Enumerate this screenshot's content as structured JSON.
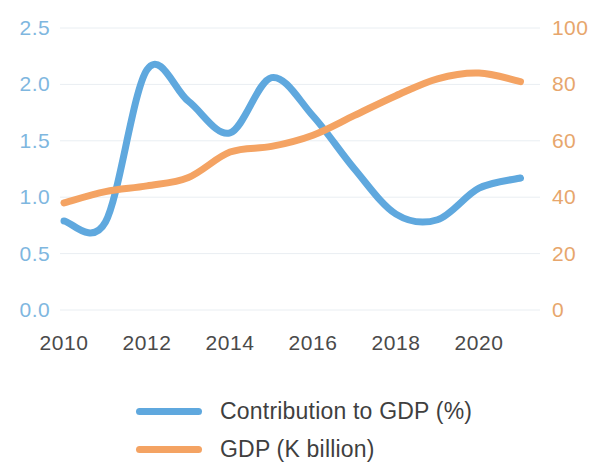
{
  "chart_data": {
    "type": "line",
    "title": "",
    "xlabel": "",
    "grid": true,
    "legend_position": "bottom",
    "x": [
      2010,
      2011,
      2012,
      2013,
      2014,
      2015,
      2016,
      2017,
      2018,
      2019,
      2020,
      2021
    ],
    "x_ticks": [
      "2010",
      "2012",
      "2014",
      "2016",
      "2018",
      "2020"
    ],
    "x_tick_values": [
      2010,
      2012,
      2014,
      2016,
      2018,
      2020
    ],
    "xlim": [
      2010,
      2021
    ],
    "axes": [
      {
        "id": "left",
        "label": "Contribution to GDP (%)",
        "ylabel": "",
        "ylim": [
          0.0,
          2.5
        ],
        "ticks": [
          "0.0",
          "0.5",
          "1.0",
          "1.5",
          "2.0",
          "2.5"
        ],
        "tick_values": [
          0.0,
          0.5,
          1.0,
          1.5,
          2.0,
          2.5
        ],
        "color": "#7FB7DF"
      },
      {
        "id": "right",
        "label": "GDP (K billion)",
        "ylabel": "",
        "ylim": [
          0,
          100
        ],
        "ticks": [
          "0",
          "20",
          "40",
          "60",
          "80",
          "100"
        ],
        "tick_values": [
          0,
          20,
          40,
          60,
          80,
          100
        ],
        "color": "#E7A66C"
      }
    ],
    "series": [
      {
        "name": "Contribution to GDP (%)",
        "axis": "left",
        "color": "#5FA8DE",
        "values": [
          0.79,
          0.78,
          2.13,
          1.85,
          1.57,
          2.06,
          1.72,
          1.25,
          0.85,
          0.8,
          1.08,
          1.17
        ]
      },
      {
        "name": "GDP (K billion)",
        "axis": "right",
        "color": "#F4A363",
        "values": [
          38,
          42,
          44,
          47,
          56,
          58,
          62,
          69,
          76,
          82,
          84,
          81
        ]
      }
    ]
  },
  "legend": {
    "items": [
      {
        "label": "Contribution to GDP (%)",
        "color": "#5FA8DE",
        "swatch": "line-swatch"
      },
      {
        "label": "GDP (K billion)",
        "color": "#F4A363",
        "swatch": "line-swatch"
      }
    ]
  }
}
